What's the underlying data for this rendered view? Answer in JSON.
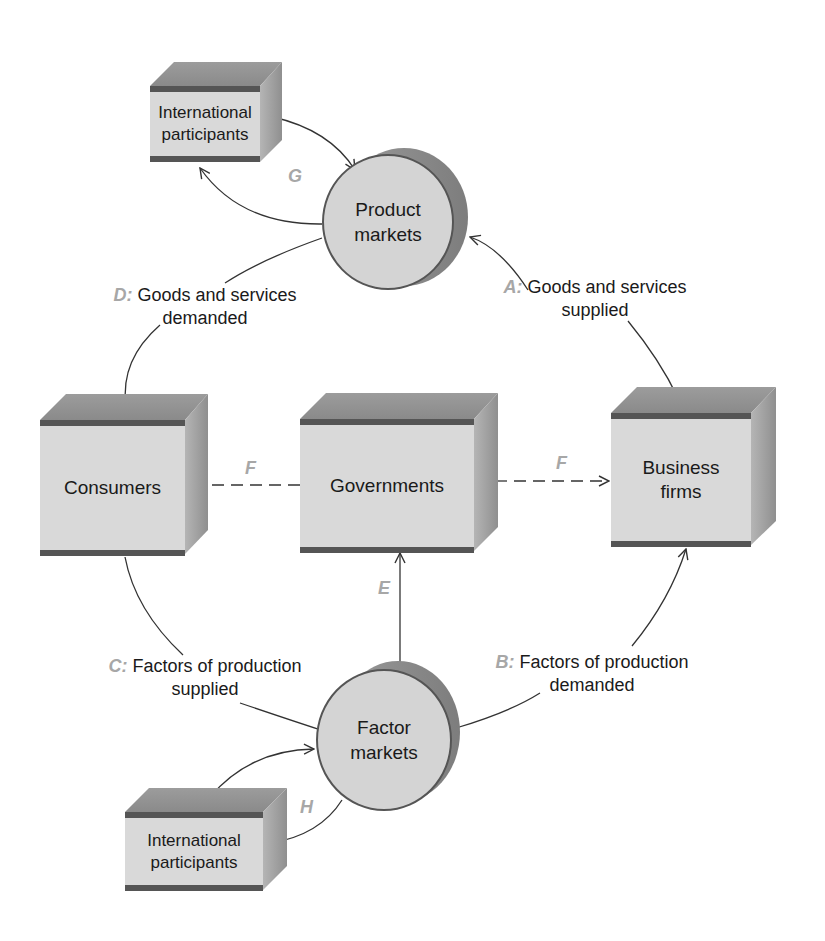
{
  "nodes": {
    "intl_top": {
      "line1": "International",
      "line2": "participants"
    },
    "product_markets": {
      "line1": "Product",
      "line2": "markets"
    },
    "consumers": {
      "label": "Consumers"
    },
    "governments": {
      "label": "Governments"
    },
    "business_firms": {
      "line1": "Business",
      "line2": "firms"
    },
    "factor_markets": {
      "line1": "Factor",
      "line2": "markets"
    },
    "intl_bottom": {
      "line1": "International",
      "line2": "participants"
    }
  },
  "flows": {
    "A": {
      "letter": "A:",
      "line1": "Goods and services",
      "line2": "supplied"
    },
    "B": {
      "letter": "B:",
      "line1": "Factors of production",
      "line2": "demanded"
    },
    "C": {
      "letter": "C:",
      "line1": "Factors of production",
      "line2": "supplied"
    },
    "D": {
      "letter": "D:",
      "line1": "Goods and services",
      "line2": "demanded"
    },
    "E": {
      "letter": "E"
    },
    "F_left": {
      "letter": "F"
    },
    "F_right": {
      "letter": "F"
    },
    "G": {
      "letter": "G"
    },
    "H": {
      "letter": "H"
    }
  },
  "colors": {
    "box_face": "#d9d9d9",
    "box_edge": "#555555",
    "flow_letter": "#a7a7a7",
    "arrow": "#333333"
  }
}
